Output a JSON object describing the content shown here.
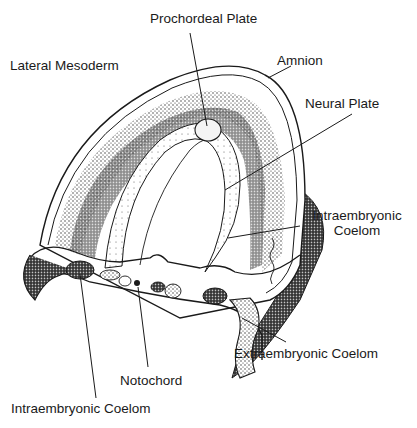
{
  "figure": {
    "colors": {
      "ink": "#1a1a1a",
      "background": "#ffffff",
      "stipple": "#2a2a2a"
    }
  },
  "labels": {
    "prochordeal_plate": "Prochordeal Plate",
    "lateral_mesoderm": "Lateral Mesoderm",
    "amnion": "Amnion",
    "neural_plate": "Neural Plate",
    "intraembryonic_coelom_right_line1": "Intraembryonic",
    "intraembryonic_coelom_right_line2": "Coelom",
    "extraembryonic_coelom": "Extraembryonic Coelom",
    "notochord": "Notochord",
    "intraembryonic_coelom_bottom": "Intraembryonic Coelom"
  },
  "signature": "artist signature (vertical script)"
}
